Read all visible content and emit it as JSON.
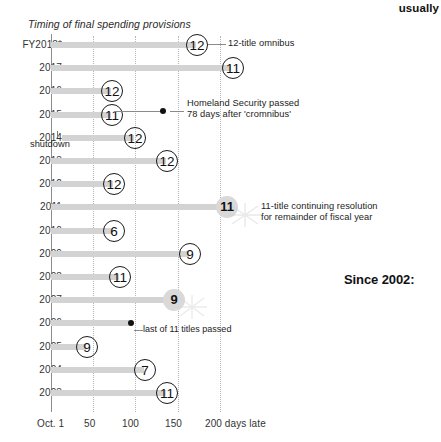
{
  "top_fragment": "usually",
  "chart_title": "Timing of final spending provisions",
  "since_note": "Since 2002:",
  "axis": {
    "ticks": [
      {
        "label": "Oct. 1",
        "value": 0
      },
      {
        "label": "50",
        "value": 50
      },
      {
        "label": "100",
        "value": 100
      },
      {
        "label": "150",
        "value": 150
      },
      {
        "label": "200 days late",
        "value": 200
      }
    ]
  },
  "annotations": {
    "omnibus": "12-title omnibus",
    "homeland_line1": "Homeland Security passed",
    "homeland_line2": "78 days after 'cromnibus'",
    "cr_line1": "11-title continuing resolution",
    "cr_line2": "for remainder of fiscal year",
    "last_titles": "last of 11 titles passed",
    "shutdown": "shutdown"
  },
  "chart_data": {
    "type": "bar",
    "title": "Timing of final spending provisions",
    "xlabel": "days late",
    "ylabel": "Fiscal year",
    "xlim": [
      0,
      215
    ],
    "grid": "vertical dotted at 50, 100, 150, 200",
    "orientation": "horizontal",
    "categories": [
      "FY2018*",
      "2017",
      "2016",
      "2015",
      "2014",
      "2013",
      "2012",
      "2011",
      "2010",
      "2009",
      "2008",
      "2007",
      "2006",
      "2005",
      "2004",
      "2003"
    ],
    "values": [
      172,
      213,
      70,
      70,
      98,
      136,
      73,
      207,
      73,
      163,
      80,
      144,
      94,
      40,
      110,
      136
    ],
    "bar_start_days": [
      0,
      0,
      0,
      0,
      13,
      0,
      0,
      0,
      0,
      0,
      0,
      0,
      0,
      0,
      0,
      0
    ],
    "markers": [
      "12",
      "11",
      "12",
      "11",
      "12",
      "12",
      "12",
      "11",
      "6",
      "9",
      "11",
      "9",
      "",
      "9",
      "7",
      "11"
    ],
    "marker_style": [
      "circle",
      "circle",
      "circle",
      "circle",
      "circle",
      "circle",
      "circle",
      "soft",
      "circle",
      "circle",
      "circle",
      "soft",
      "dot",
      "circle",
      "circle",
      "circle"
    ],
    "extra_points": [
      {
        "category": "2015",
        "days": 148,
        "label": "Homeland Security passed / 78 days after 'cromnibus'"
      },
      {
        "category": "2006",
        "days": 94,
        "label": "last of 11 titles passed"
      }
    ]
  },
  "rows": [
    {
      "year": "FY2018*",
      "bar_start": 51,
      "bar_end": 196,
      "marker": "12",
      "style": "circle",
      "marker_x": 186
    },
    {
      "year": "2017",
      "bar_start": 51,
      "bar_end": 231,
      "marker": "11",
      "style": "circle",
      "marker_x": 222
    },
    {
      "year": "2016",
      "bar_start": 51,
      "bar_end": 111,
      "marker": "12",
      "style": "circle",
      "marker_x": 101
    },
    {
      "year": "2015",
      "bar_start": 51,
      "bar_end": 111,
      "marker": "11",
      "style": "circle",
      "marker_x": 101
    },
    {
      "year": "2014",
      "bar_start": 62,
      "bar_end": 134,
      "marker": "12",
      "style": "circle",
      "marker_x": 124
    },
    {
      "year": "2013",
      "bar_start": 51,
      "bar_end": 166,
      "marker": "12",
      "style": "circle",
      "marker_x": 156
    },
    {
      "year": "2012",
      "bar_start": 51,
      "bar_end": 113,
      "marker": "12",
      "style": "circle",
      "marker_x": 103
    },
    {
      "year": "2011",
      "bar_start": 51,
      "bar_end": 226,
      "marker": "11",
      "style": "soft",
      "marker_x": 216
    },
    {
      "year": "2010",
      "bar_start": 51,
      "bar_end": 113,
      "marker": "6",
      "style": "circle",
      "marker_x": 103
    },
    {
      "year": "2009",
      "bar_start": 51,
      "bar_end": 189,
      "marker": "9",
      "style": "circle",
      "marker_x": 179
    },
    {
      "year": "2008",
      "bar_start": 51,
      "bar_end": 119,
      "marker": "11",
      "style": "circle",
      "marker_x": 109
    },
    {
      "year": "2007",
      "bar_start": 51,
      "bar_end": 173,
      "marker": "9",
      "style": "soft",
      "marker_x": 163
    },
    {
      "year": "2006",
      "bar_start": 51,
      "bar_end": 131,
      "marker": "",
      "style": "dot",
      "marker_x": 128
    },
    {
      "year": "2005",
      "bar_start": 51,
      "bar_end": 86,
      "marker": "9",
      "style": "circle",
      "marker_x": 76
    },
    {
      "year": "2004",
      "bar_start": 51,
      "bar_end": 144,
      "marker": "7",
      "style": "circle",
      "marker_x": 134
    },
    {
      "year": "2003",
      "bar_start": 51,
      "bar_end": 166,
      "marker": "11",
      "style": "circle",
      "marker_x": 156
    }
  ]
}
